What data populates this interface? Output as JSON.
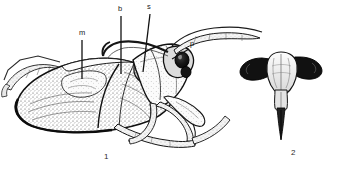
{
  "plate": {
    "background_color": "#ffffff",
    "ink_color": "#1a1a1a",
    "description": "Black and white scientific line illustration plate of a water bug (Hemiptera), two figures",
    "width": 344,
    "height": 172
  },
  "figures": [
    {
      "number": "1",
      "view": "lateral habitus",
      "number_x": 104,
      "number_y": 153
    },
    {
      "number": "2",
      "view": "dorsal head with rostrum",
      "number_x": 291,
      "number_y": 149
    }
  ],
  "callouts": [
    {
      "label": "m",
      "name": "membrane",
      "label_x": 79,
      "label_y": 34,
      "line_x1": 82,
      "line_y1": 40,
      "line_x2": 82,
      "line_y2": 79
    },
    {
      "label": "b",
      "name": "beak",
      "label_x": 118,
      "label_y": 10,
      "line_x1": 121,
      "line_y1": 16,
      "line_x2": 121,
      "line_y2": 74
    },
    {
      "label": "s",
      "name": "scutellum",
      "label_x": 147,
      "label_y": 8,
      "line_x1": 150,
      "line_y1": 14,
      "line_x2": 143,
      "line_y2": 72
    },
    {
      "label": "p",
      "name": "pronotum",
      "label_x": 190,
      "label_y": 44,
      "line_x1": 189,
      "line_y1": 49,
      "line_x2": 172,
      "line_y2": 59
    }
  ],
  "colors": {
    "ink": "#1a1a1a",
    "mid_tone": "#6d6d6d",
    "light_tone": "#c9c9c9",
    "eye_dark": "#111111",
    "paper": "#ffffff"
  }
}
